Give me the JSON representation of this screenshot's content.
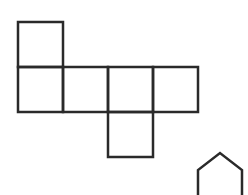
{
  "diagram": {
    "title": "",
    "stroke_color": "#2a2a2a",
    "background": "#ffffff",
    "stroke_width": 2.5,
    "cube_net": {
      "cell_size": 45,
      "origin": [
        18,
        22
      ],
      "cells": [
        {
          "id": "top",
          "col": 0,
          "row": 0
        },
        {
          "id": "mid-1",
          "col": 0,
          "row": 1
        },
        {
          "id": "mid-2",
          "col": 1,
          "row": 1
        },
        {
          "id": "mid-3",
          "col": 2,
          "row": 1
        },
        {
          "id": "mid-4",
          "col": 3,
          "row": 1
        },
        {
          "id": "bottom",
          "col": 2,
          "row": 2
        }
      ]
    },
    "partial_shape": {
      "type": "pentagon-top",
      "points": [
        [
          198,
          196
        ],
        [
          198,
          170
        ],
        [
          220,
          153
        ],
        [
          242,
          170
        ],
        [
          242,
          196
        ]
      ]
    }
  }
}
